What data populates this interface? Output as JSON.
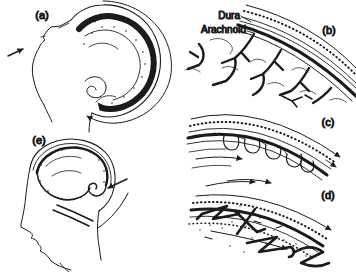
{
  "figure": {
    "colors": {
      "ink": "#1b1b1b",
      "background": "#ffffff",
      "panel_letter": "#2e2e2e"
    },
    "panels": {
      "a": {
        "label": "(a)"
      },
      "b": {
        "label": "(b)"
      },
      "c": {
        "label": "(c)"
      },
      "d": {
        "label": "(d)"
      },
      "e": {
        "label": "(e)"
      }
    },
    "annotations": {
      "dura": "Dura",
      "arachnoid": "Arachnoid"
    }
  }
}
